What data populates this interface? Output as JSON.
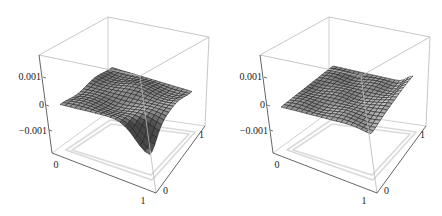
{
  "figure": {
    "panels": [
      {
        "id": "left",
        "z_ticks": [
          "0.001",
          "0",
          "−0.001"
        ],
        "x_ticks": [
          "0",
          "1"
        ],
        "y_ticks": [
          "0",
          "1"
        ]
      },
      {
        "id": "right",
        "z_ticks": [
          "0.001",
          "0",
          "−0.001"
        ],
        "x_ticks": [
          "0",
          "1"
        ],
        "y_ticks": [
          "0",
          "1"
        ]
      }
    ],
    "colors": {
      "box_edge": "#b8b8b8",
      "axis_line": "#555555",
      "floor_frame": "#d8d8d8",
      "mesh_line": "#1a1a1a",
      "surface_light": "#e6e6e6",
      "surface_dark": "#5a5a5a"
    }
  },
  "chart_data": [
    {
      "type": "surface3d",
      "title": "",
      "xlabel": "",
      "ylabel": "",
      "zlabel": "",
      "x_range": [
        0,
        1
      ],
      "y_range": [
        0,
        1
      ],
      "z_range": [
        -0.0015,
        0.0015
      ],
      "x_ticks": [
        0,
        1
      ],
      "y_ticks": [
        0,
        1
      ],
      "z_ticks": [
        -0.001,
        0,
        0.001
      ],
      "grid": "mesh ~20x20",
      "description": "Wavy surface near zero with a pronounced downward dip toward z≈-0.0012 at corner (x=1,y=0); slight ripples elsewhere around 0 to 0.0005"
    },
    {
      "type": "surface3d",
      "title": "",
      "xlabel": "",
      "ylabel": "",
      "zlabel": "",
      "x_range": [
        0,
        1
      ],
      "y_range": [
        0,
        1
      ],
      "z_range": [
        -0.0015,
        0.0015
      ],
      "x_ticks": [
        0,
        1
      ],
      "y_ticks": [
        0,
        1
      ],
      "z_ticks": [
        -0.001,
        0,
        0.001
      ],
      "grid": "mesh ~20x20",
      "description": "Nearly flat surface near z≈0 with small ripples; slight upturn to ~0.001 at corner (x=1,y=1) edge and slight dip near (x=1,y=0)"
    }
  ]
}
